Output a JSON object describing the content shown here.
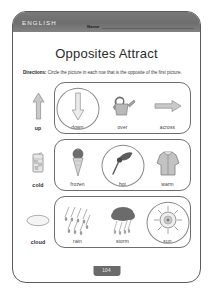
{
  "page": {
    "subject": "ENGLISH",
    "name_label": "Name",
    "name_value": "",
    "title": "Opposites Attract",
    "directions_lead": "Directions:",
    "directions_text": " Circle the picture in each row that is the opposite of the first picture.",
    "page_number": "104",
    "header_color": "#6e6e6e",
    "badge_color": "#6a6a6a",
    "ink_color": "#3a3a3a"
  },
  "rows": [
    {
      "prompt": {
        "label": "up",
        "icon": "arrow-up-icon"
      },
      "options": [
        {
          "label": "down",
          "icon": "arrow-down-icon",
          "circled": true
        },
        {
          "label": "over",
          "icon": "watering-can-icon",
          "circled": false
        },
        {
          "label": "across",
          "icon": "arrow-right-icon",
          "circled": false
        }
      ]
    },
    {
      "prompt": {
        "label": "cold",
        "icon": "iced-drink-icon"
      },
      "options": [
        {
          "label": "frozen",
          "icon": "ice-cream-cone-icon",
          "circled": false
        },
        {
          "label": "hot",
          "icon": "torch-flame-icon",
          "circled": true
        },
        {
          "label": "warm",
          "icon": "jacket-icon",
          "circled": false
        }
      ]
    },
    {
      "prompt": {
        "label": "cloud",
        "icon": "cloud-icon"
      },
      "options": [
        {
          "label": "rain",
          "icon": "rain-drops-icon",
          "circled": false
        },
        {
          "label": "storm",
          "icon": "storm-cloud-icon",
          "circled": false
        },
        {
          "label": "sun",
          "icon": "sun-icon",
          "circled": true
        }
      ]
    }
  ]
}
